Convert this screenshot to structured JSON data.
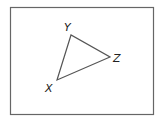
{
  "diagram": {
    "type": "triangle",
    "frame": {
      "x": 10,
      "y": 7,
      "width": 144,
      "height": 108,
      "stroke": "#555555"
    },
    "stroke_color": "#555555",
    "vertices": [
      {
        "name": "X",
        "x": 57,
        "y": 80,
        "label": "X",
        "label_x": 45,
        "label_y": 92
      },
      {
        "name": "Y",
        "x": 71,
        "y": 35,
        "label": "Y",
        "label_x": 64,
        "label_y": 31
      },
      {
        "name": "Z",
        "x": 110,
        "y": 57,
        "label": "Z",
        "label_x": 113,
        "label_y": 62
      }
    ],
    "edges": [
      [
        "X",
        "Y"
      ],
      [
        "Y",
        "Z"
      ],
      [
        "Z",
        "X"
      ]
    ]
  }
}
